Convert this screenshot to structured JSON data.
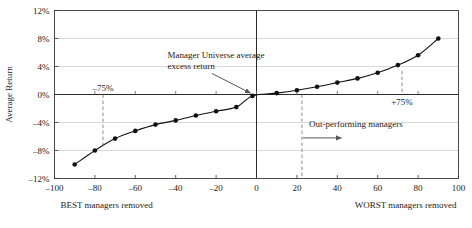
{
  "chart_data": {
    "type": "scatter",
    "title": "",
    "xlabel_left": "BEST managers removed",
    "xlabel_right": "WORST managers removed",
    "ylabel": "Average Return",
    "xlim": [
      -100,
      100
    ],
    "ylim": [
      -12,
      12
    ],
    "xticks": [
      -100,
      -80,
      -60,
      -40,
      -20,
      0,
      20,
      40,
      60,
      80,
      100
    ],
    "xtick_labels": [
      "–100",
      "–80",
      "–60",
      "–40",
      "–20",
      "0",
      "20",
      "40",
      "60",
      "80",
      "100"
    ],
    "yticks": [
      -12,
      -8,
      -4,
      0,
      4,
      8,
      12
    ],
    "ytick_labels": [
      "–12%",
      "–8%",
      "–4%",
      "0%",
      "4%",
      "8%",
      "12%"
    ],
    "grid": true,
    "legend": "none",
    "series": [
      {
        "name": "Average excess return",
        "marker": "filled-circle",
        "marker_color": "#111111",
        "line_color": "#111111",
        "points": [
          {
            "x": -90,
            "y": -10.0
          },
          {
            "x": -80,
            "y": -8.0
          },
          {
            "x": -70,
            "y": -6.3
          },
          {
            "x": -60,
            "y": -5.2
          },
          {
            "x": -50,
            "y": -4.3
          },
          {
            "x": -40,
            "y": -3.7
          },
          {
            "x": -30,
            "y": -3.0
          },
          {
            "x": -20,
            "y": -2.4
          },
          {
            "x": -10,
            "y": -1.8
          },
          {
            "x": -2,
            "y": -0.2
          },
          {
            "x": 10,
            "y": 0.2
          },
          {
            "x": 20,
            "y": 0.6
          },
          {
            "x": 30,
            "y": 1.1
          },
          {
            "x": 40,
            "y": 1.7
          },
          {
            "x": 50,
            "y": 2.3
          },
          {
            "x": 60,
            "y": 3.1
          },
          {
            "x": 70,
            "y": 4.2
          },
          {
            "x": 80,
            "y": 5.6
          },
          {
            "x": 90,
            "y": 8.0
          }
        ]
      }
    ],
    "annotations": [
      {
        "name": "manager-universe-average",
        "text_line1": "Manager Universe average",
        "text_line2": "excess return",
        "text_x": -44,
        "text_y": 5.2,
        "arrow_from_x": -22,
        "arrow_from_y": 3.0,
        "arrow_to_x": -3,
        "arrow_to_y": 0.2
      },
      {
        "name": "out-performing-managers",
        "text_line1": "Out-performing managers",
        "text_line2": "",
        "text_x": 26,
        "text_y": -4.6,
        "arrow_from_x": 23,
        "arrow_from_y": -6.2,
        "arrow_to_x": 42,
        "arrow_to_y": -6.2
      }
    ],
    "reference_lines": [
      {
        "name": "minus-75",
        "x": -76,
        "label": "–75%",
        "label_position": "above-axis",
        "style": "dashed",
        "y_top": 0,
        "y_bottom": -7.2
      },
      {
        "name": "plus-75",
        "x": 72,
        "label": "+75%",
        "label_position": "below-axis",
        "style": "dashed",
        "y_top": 3.4,
        "y_bottom": 0
      },
      {
        "name": "out-performing-boundary",
        "x": 22.5,
        "label": "",
        "label_position": "none",
        "style": "dashed",
        "y_top": 0,
        "y_bottom": -12
      }
    ],
    "zero_axis": {
      "x": 0,
      "y": 0
    }
  }
}
